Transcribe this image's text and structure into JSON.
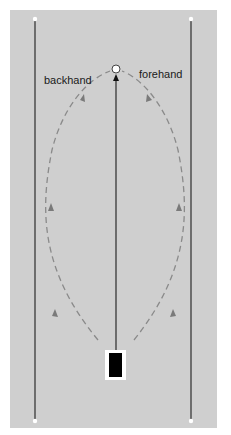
{
  "diagram": {
    "labels": {
      "backhand": "backhand",
      "forehand": "forehand"
    },
    "colors": {
      "court": "#cfcfcf",
      "boundary_line": "#3a3a3a",
      "dashed_path": "#8a8a8a",
      "player": "#000000",
      "target": "#ffffff"
    },
    "elements": {
      "left_line": "vertical boundary line with end markers",
      "right_line": "vertical boundary line with end markers",
      "center_arrow": "straight path from player to target",
      "target": "circle target",
      "player": "black rectangle player marker"
    }
  }
}
